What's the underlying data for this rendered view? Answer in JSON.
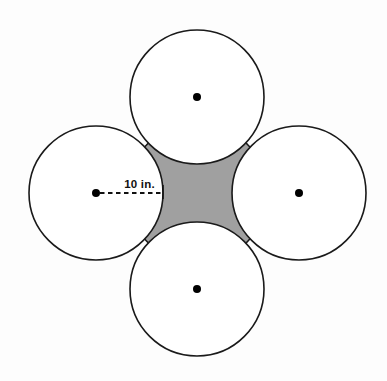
{
  "figure": {
    "background_color": "#fdfdfd",
    "stroke_color": "#1a1a1a",
    "circle_fill": "#ffffff",
    "shaded_fill": "#a0a0a0",
    "dot_color": "#000000",
    "dimension": {
      "label": "10 in.",
      "value": 10,
      "unit": "in.",
      "measures": "radius",
      "from": "left-circle-center",
      "to": "left-circle-right-edge",
      "line_style": "dashed"
    },
    "circles": [
      {
        "name": "top-circle",
        "cx": 197,
        "cy": 97,
        "r": 67,
        "center_dot": true
      },
      {
        "name": "left-circle",
        "cx": 96,
        "cy": 193,
        "r": 67,
        "center_dot": true
      },
      {
        "name": "right-circle",
        "cx": 299,
        "cy": 193,
        "r": 67,
        "center_dot": true
      },
      {
        "name": "bottom-circle",
        "cx": 197,
        "cy": 289,
        "r": 67,
        "center_dot": true
      }
    ],
    "center_dot_radius": 4,
    "shaded_region": {
      "name": "curvilinear-square",
      "description": "concave square bounded by four circular arcs between the tangent circles",
      "fill": "#a0a0a0"
    }
  }
}
